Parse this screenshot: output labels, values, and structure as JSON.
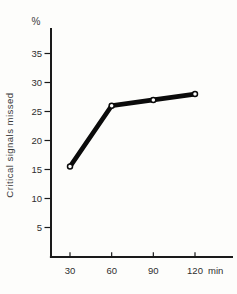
{
  "figure": {
    "y_axis_unit": "%",
    "y_axis_label": "Critical signals missed",
    "x_axis_unit": "min"
  },
  "chart_data": {
    "type": "line",
    "title": "",
    "x": [
      30,
      60,
      90,
      120
    ],
    "series": [
      {
        "name": "Critical signals missed",
        "values": [
          15.5,
          26,
          27,
          28
        ]
      }
    ],
    "xlabel": "min",
    "ylabel": "Critical signals missed",
    "y_unit": "%",
    "xticks": [
      30,
      60,
      90,
      120
    ],
    "xtick_labels": [
      "30",
      "60",
      "90",
      "120"
    ],
    "yticks": [
      5,
      10,
      15,
      20,
      25,
      30,
      35
    ],
    "ytick_labels": [
      "5",
      "10",
      "15",
      "20",
      "25",
      "30",
      "35"
    ],
    "xlim": [
      16,
      147
    ],
    "ylim": [
      0,
      39.4
    ],
    "grid": false,
    "legend": "none",
    "marker": "open-circle",
    "line_width": 4.6,
    "colors": {
      "line": "#0b0b0b",
      "marker_fill": "#ffffff",
      "axis": "#1a1a1a",
      "tick_text": "#2e2e2e",
      "label_text": "#3a3a3a",
      "background": "#fdfdfb"
    }
  }
}
